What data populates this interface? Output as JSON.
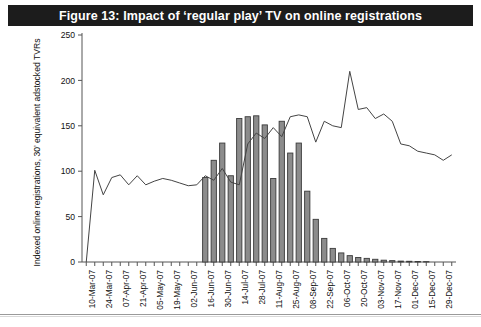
{
  "figure": {
    "title": "Figure 13: Impact of ‘regular play’ TV on online registrations",
    "title_bar_color": "#1c1c1c",
    "title_text_color": "#ffffff"
  },
  "chart_data": {
    "type": "bar",
    "title": "Figure 13: Impact of ‘regular play’ TV on online registrations",
    "xlabel": "",
    "ylabel": "Indexed online registrations, 30’ equivalent adstocked TVRs",
    "ylim": [
      0,
      250
    ],
    "yticks": [
      0,
      50,
      100,
      150,
      200,
      250
    ],
    "grid": false,
    "legend": "none",
    "axis_color": "#555555",
    "bar_fill_color": "#8c8c8c",
    "bar_edge_color": "#3a3a3a",
    "line_color": "#444444",
    "x": [
      "03-Mar-07",
      "10-Mar-07",
      "17-Mar-07",
      "24-Mar-07",
      "31-Mar-07",
      "07-Apr-07",
      "14-Apr-07",
      "21-Apr-07",
      "28-Apr-07",
      "05-May-07",
      "12-May-07",
      "19-May-07",
      "26-May-07",
      "02-Jun-07",
      "09-Jun-07",
      "16-Jun-07",
      "23-Jun-07",
      "30-Jun-07",
      "07-Jul-07",
      "14-Jul-07",
      "21-Jul-07",
      "28-Jul-07",
      "04-Aug-07",
      "11-Aug-07",
      "18-Aug-07",
      "25-Aug-07",
      "01-Sep-07",
      "08-Sep-07",
      "15-Sep-07",
      "22-Sep-07",
      "29-Sep-07",
      "06-Oct-07",
      "13-Oct-07",
      "20-Oct-07",
      "27-Oct-07",
      "03-Nov-07",
      "10-Nov-07",
      "17-Nov-07",
      "24-Nov-07",
      "01-Dec-07",
      "08-Dec-07",
      "15-Dec-07",
      "22-Dec-07",
      "29-Dec-07"
    ],
    "xtick_labels": [
      "10-Mar-07",
      "24-Mar-07",
      "07-Apr-07",
      "21-Apr-07",
      "05-May-07",
      "19-May-07",
      "02-Jun-07",
      "16-Jun-07",
      "30-Jun-07",
      "14-Jul-07",
      "28-Jul-07",
      "11-Aug-07",
      "25-Aug-07",
      "08-Sep-07",
      "22-Sep-07",
      "06-Oct-07",
      "20-Oct-07",
      "03-Nov-07",
      "17-Nov-07",
      "01-Dec-07",
      "15-Dec-07",
      "29-Dec-07"
    ],
    "xtick_every": 2,
    "series": [
      {
        "name": "Indexed online registrations",
        "type": "line",
        "values": [
          0,
          101,
          74,
          93,
          96,
          85,
          95,
          85,
          89,
          92,
          90,
          87,
          84,
          85,
          95,
          90,
          103,
          88,
          85,
          130,
          142,
          136,
          148,
          138,
          160,
          162,
          160,
          132,
          155,
          150,
          148,
          210,
          168,
          170,
          158,
          163,
          155,
          130,
          128,
          122,
          120,
          118,
          112,
          118
        ]
      },
      {
        "name": "30’ equivalent adstocked TVRs",
        "type": "bar",
        "values": [
          0,
          0,
          0,
          0,
          0,
          0,
          0,
          0,
          0,
          0,
          0,
          0,
          0,
          0,
          93,
          112,
          131,
          95,
          158,
          160,
          161,
          151,
          92,
          155,
          120,
          131,
          78,
          47,
          26,
          15,
          10,
          7,
          5,
          4,
          3,
          2,
          1.5,
          1,
          0.8,
          0.5,
          0.4,
          0.3,
          0.2,
          0
        ]
      }
    ]
  }
}
